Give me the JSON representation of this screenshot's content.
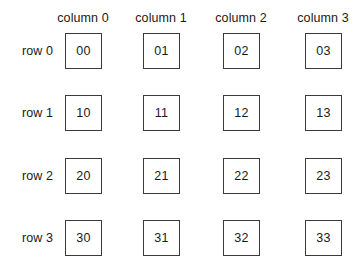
{
  "figure": {
    "background_color": "#ffffff",
    "border_color": "#3a3a3a",
    "text_color": "#1a1a1a"
  },
  "columns": [
    {
      "label": "column 0",
      "index": 0,
      "center_x": 83
    },
    {
      "label": "column 1",
      "index": 1,
      "center_x": 161
    },
    {
      "label": "column 2",
      "index": 2,
      "center_x": 241
    },
    {
      "label": "column 3",
      "index": 3,
      "center_x": 323
    }
  ],
  "rows": [
    {
      "label": "row 0",
      "index": 0,
      "center_y": 51
    },
    {
      "label": "row 1",
      "index": 1,
      "center_y": 113
    },
    {
      "label": "row 2",
      "index": 2,
      "center_y": 176
    },
    {
      "label": "row 3",
      "index": 3,
      "center_y": 238
    }
  ],
  "cells": [
    {
      "value": "00",
      "row": 0,
      "col": 0,
      "x": 65,
      "y": 33
    },
    {
      "value": "01",
      "row": 0,
      "col": 1,
      "x": 143,
      "y": 33
    },
    {
      "value": "02",
      "row": 0,
      "col": 2,
      "x": 223,
      "y": 33
    },
    {
      "value": "03",
      "row": 0,
      "col": 3,
      "x": 305,
      "y": 33
    },
    {
      "value": "10",
      "row": 1,
      "col": 0,
      "x": 65,
      "y": 95
    },
    {
      "value": "11",
      "row": 1,
      "col": 1,
      "x": 143,
      "y": 95
    },
    {
      "value": "12",
      "row": 1,
      "col": 2,
      "x": 223,
      "y": 95
    },
    {
      "value": "13",
      "row": 1,
      "col": 3,
      "x": 305,
      "y": 95
    },
    {
      "value": "20",
      "row": 2,
      "col": 0,
      "x": 65,
      "y": 158
    },
    {
      "value": "21",
      "row": 2,
      "col": 1,
      "x": 143,
      "y": 158
    },
    {
      "value": "22",
      "row": 2,
      "col": 2,
      "x": 223,
      "y": 158
    },
    {
      "value": "23",
      "row": 2,
      "col": 3,
      "x": 305,
      "y": 158
    },
    {
      "value": "30",
      "row": 3,
      "col": 0,
      "x": 65,
      "y": 220
    },
    {
      "value": "31",
      "row": 3,
      "col": 1,
      "x": 143,
      "y": 220
    },
    {
      "value": "32",
      "row": 3,
      "col": 2,
      "x": 223,
      "y": 220
    },
    {
      "value": "33",
      "row": 3,
      "col": 3,
      "x": 305,
      "y": 220
    }
  ]
}
